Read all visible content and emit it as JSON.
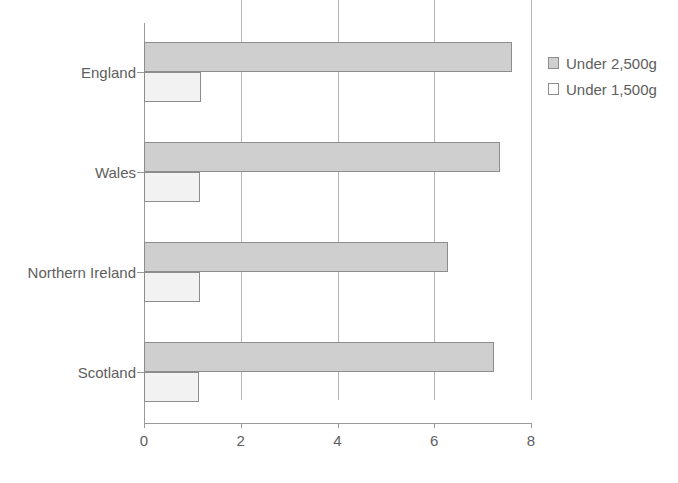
{
  "chart_data": {
    "type": "bar",
    "orientation": "horizontal",
    "title": "",
    "xlabel": "",
    "ylabel": "",
    "xlim": [
      0,
      8
    ],
    "xticks": [
      0,
      2,
      4,
      6,
      8
    ],
    "xtick_labels": [
      "0",
      "2",
      "4",
      "6",
      "8"
    ],
    "grid": "vertical",
    "legend_position": "right",
    "categories": [
      "England",
      "Wales",
      "Northern Ireland",
      "Scotland"
    ],
    "series": [
      {
        "name": "Under 2,500g",
        "color": "#cfcfcf",
        "values": [
          7.6,
          7.35,
          6.28,
          7.23
        ]
      },
      {
        "name": "Under 1,500g",
        "color": "#f2f2f2",
        "values": [
          1.18,
          1.15,
          1.15,
          1.13
        ]
      }
    ]
  },
  "colors": {
    "series_under_2500": "#cfcfcf",
    "series_under_1500": "#f2f2f2",
    "bar_border": "#8d8d8d",
    "axis": "#9a9a9a",
    "gridline": "#b5b5b5",
    "text": "#5e5e5e",
    "background": "#ffffff"
  }
}
